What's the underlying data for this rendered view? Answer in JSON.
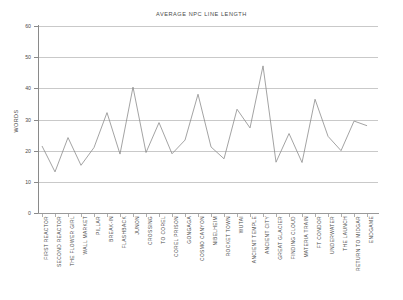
{
  "chart_data": {
    "type": "line",
    "title": "AVERAGE NPC LINE LENGTH",
    "xlabel": "",
    "ylabel": "WORDS",
    "ylim": [
      0,
      60
    ],
    "yticks": [
      0,
      10,
      20,
      30,
      40,
      50,
      60
    ],
    "grid": true,
    "legend": "none",
    "line_color": "#8c8c8c",
    "categories": [
      "FIRST REACTOR",
      "SECOND REACTOR",
      "THE FLOWER GIRL",
      "WALL MARKET",
      "PILLAR",
      "BREAK-IN",
      "FLASHBACK",
      "JUNON",
      "CROSSING",
      "TO COREL",
      "COREL PRISON",
      "GONGAGA",
      "COSMO CANYON",
      "NIBELHEIM",
      "ROCKET TOWN",
      "WUTAI",
      "ANCIENT TEMPLE",
      "ANCIENT CITY",
      "GREAT GLACIER",
      "FINDING CLOUD",
      "MATERIA TRAIN",
      "FT CONDOR",
      "UNDERWATER",
      "THE LAUNCH",
      "RETURN TO MIDGAR",
      "ENDGAME"
    ],
    "values": [
      21.5,
      13.2,
      24.2,
      15.3,
      21.0,
      32.2,
      18.9,
      40.4,
      19.4,
      29.0,
      19.0,
      23.4,
      38.1,
      21.2,
      17.4,
      33.3,
      27.3,
      47.2,
      16.3,
      25.5,
      16.2,
      36.5,
      24.6,
      20.0,
      29.5,
      28.0
    ],
    "series": [
      {
        "name": "Average NPC line length",
        "values": [
          21.5,
          13.2,
          24.2,
          15.3,
          21.0,
          32.2,
          18.9,
          40.4,
          19.4,
          29.0,
          19.0,
          23.4,
          38.1,
          21.2,
          17.4,
          33.3,
          27.3,
          47.2,
          16.3,
          25.5,
          16.2,
          36.5,
          24.6,
          20.0,
          29.5,
          28.0
        ]
      }
    ]
  }
}
